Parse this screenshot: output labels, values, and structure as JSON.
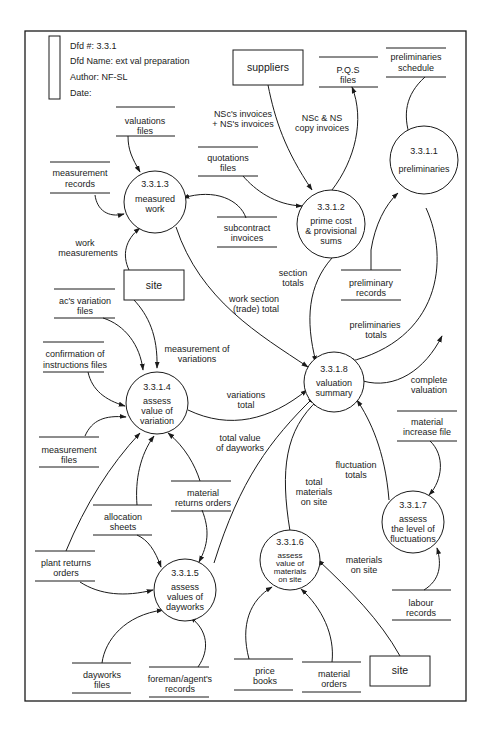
{
  "header": {
    "dfd_number_label": "Dfd #: 3.3.1",
    "dfd_name_label": "Dfd Name: ext val preparation",
    "author_label": "Author: NF-SL",
    "date_label": "Date:"
  },
  "processes": [
    {
      "id": "3.3.1.1",
      "line1": "preliminaries",
      "line2": "",
      "line3": ""
    },
    {
      "id": "3.3.1.2",
      "line1": "prime cost",
      "line2": "& provisional",
      "line3": "sums"
    },
    {
      "id": "3.3.1.3",
      "line1": "measured",
      "line2": "work",
      "line3": ""
    },
    {
      "id": "3.3.1.4",
      "line1": "assess",
      "line2": "value of",
      "line3": "variation"
    },
    {
      "id": "3.3.1.5",
      "line1": "assess",
      "line2": "values of",
      "line3": "dayworks"
    },
    {
      "id": "3.3.1.6",
      "line1": "assess",
      "line2": "value of",
      "line3": "materials",
      "line4": "on site"
    },
    {
      "id": "3.3.1.7",
      "line1": "assess",
      "line2": "the level of",
      "line3": "fluctuations"
    },
    {
      "id": "3.3.1.8",
      "line1": "valuation",
      "line2": "summary",
      "line3": ""
    }
  ],
  "entities": {
    "suppliers": "suppliers",
    "site_top": "site",
    "site_bottom": "site"
  },
  "stores": {
    "pqs_files": [
      "P.Q.S",
      "files"
    ],
    "preliminaries_schedule": [
      "preliminaries",
      "schedule"
    ],
    "valuations_files": [
      "valuations",
      "files"
    ],
    "quotations_files": [
      "quotations",
      "files"
    ],
    "measurement_records": [
      "measurement",
      "records"
    ],
    "subcontract_invoices": [
      "subcontract",
      "invoices"
    ],
    "preliminary_records": [
      "preliminary",
      "records"
    ],
    "acs_variation_files": [
      "ac's variation",
      "files"
    ],
    "confirmation_instructions_files": [
      "confirmation of",
      "instructions files"
    ],
    "measurement_files": [
      "measurement",
      "files"
    ],
    "material_returns_orders": [
      "material",
      "returns orders"
    ],
    "allocation_sheets": [
      "allocation",
      "sheets"
    ],
    "plant_returns_orders": [
      "plant returns",
      "orders"
    ],
    "material_increase_file": [
      "material",
      "increase file"
    ],
    "labour_records": [
      "labour",
      "records"
    ],
    "dayworks_files": [
      "dayworks",
      "files"
    ],
    "foreman_agents_records": [
      "foreman/agent's",
      "records"
    ],
    "price_books": [
      "price",
      "books"
    ],
    "material_orders": [
      "material",
      "orders"
    ]
  },
  "flows": {
    "nscs_invoices": [
      "NSc's invoices",
      "+ NS's invoices"
    ],
    "nsc_ns_copy_invoices": [
      "NSc & NS",
      "copy invoices"
    ],
    "work_measurements": [
      "work",
      "measurements"
    ],
    "section_totals": [
      "section",
      "totals"
    ],
    "work_section_total": [
      "work section",
      "(trade) total"
    ],
    "preliminaries_totals": [
      "preliminaries",
      "totals"
    ],
    "measurement_of_variations": [
      "measurement of",
      "variations"
    ],
    "variations_total": [
      "variations",
      "total"
    ],
    "complete_valuation": [
      "complete",
      "valuation"
    ],
    "total_value_dayworks": [
      "total value",
      "of dayworks"
    ],
    "fluctuation_totals": [
      "fluctuation",
      "totals"
    ],
    "total_materials_on_site": [
      "total",
      "materials",
      "on site"
    ],
    "materials_on_site": [
      "materials",
      "on site"
    ]
  }
}
